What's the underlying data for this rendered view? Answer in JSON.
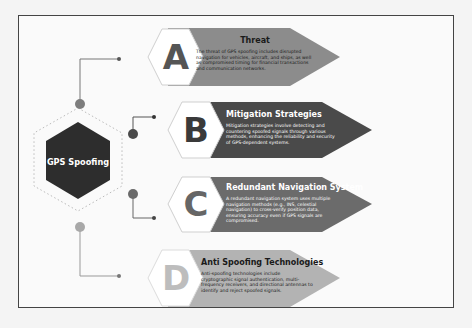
{
  "center": {
    "label": "GPS Spoofing",
    "color": "#2d2d2d"
  },
  "items": [
    {
      "letter": "A",
      "title": "Threat",
      "description": "The threat of GPS spoofing includes disrupted navigation for vehicles, aircraft, and ships, as well as compromised timing for financial transactions and communication networks.",
      "color": "#8c8c8c",
      "letter_color": "#555555",
      "dot_color": "#7d7d7d",
      "tone": "light"
    },
    {
      "letter": "B",
      "title": "Mitigation Strategies",
      "description": "Mitigation strategies involve detecting and countering spoofed signals through various methods, enhancing the reliability and security of GPS-dependent systems.",
      "color": "#4a4a4a",
      "letter_color": "#3a3a3a",
      "dot_color": "#4a4a4a",
      "tone": "dark"
    },
    {
      "letter": "C",
      "title": "Redundant Navigation System",
      "description": "A redundant navigation system uses multiple navigation methods (e.g., INS, celestial navigation) to cross-verify position data, ensuring accuracy even if GPS signals are compromised.",
      "color": "#6b6b6b",
      "letter_color": "#666666",
      "dot_color": "#6a6a6a",
      "tone": "dark"
    },
    {
      "letter": "D",
      "title": "Anti Spoofing Technologies",
      "description": "Anti-spoofing technologies include cryptographic signal authentication, multi-frequency receivers, and directional antennas to identify and reject spoofed signals.",
      "color": "#b3b3b3",
      "letter_color": "#bdbdbd",
      "dot_color": "#a8a8a8",
      "tone": "light"
    }
  ]
}
